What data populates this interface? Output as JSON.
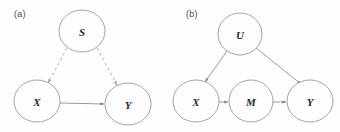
{
  "figure": {
    "background_color": "#fefefe",
    "node_fill": "#fdfdfd",
    "node_stroke": "#9a9a9a",
    "solid_edge_color": "#8e8e8e",
    "dashed_edge_color": "#a8a8a8",
    "label_color": "#2b2b2b"
  },
  "panels": [
    {
      "key": "a",
      "label": "(a)",
      "nodes": [
        {
          "id": "S",
          "label": "S",
          "cx": 82,
          "cy": 31,
          "rx": 23,
          "ry": 21
        },
        {
          "id": "X",
          "label": "X",
          "cx": 37,
          "cy": 101,
          "rx": 23,
          "ry": 21
        },
        {
          "id": "Y",
          "label": "Y",
          "cx": 128,
          "cy": 104,
          "rx": 23,
          "ry": 21
        }
      ],
      "edges": [
        {
          "from": "S",
          "to": "X",
          "style": "dashed",
          "arrow": true
        },
        {
          "from": "S",
          "to": "Y",
          "style": "dashed",
          "arrow": true
        },
        {
          "from": "X",
          "to": "Y",
          "style": "solid",
          "arrow": true
        }
      ]
    },
    {
      "key": "b",
      "label": "(b)",
      "nodes": [
        {
          "id": "U",
          "label": "U",
          "cx": 240,
          "cy": 34,
          "rx": 22,
          "ry": 21
        },
        {
          "id": "X",
          "label": "X",
          "cx": 196,
          "cy": 101,
          "rx": 23,
          "ry": 21
        },
        {
          "id": "M",
          "label": "M",
          "cx": 251,
          "cy": 101,
          "rx": 22,
          "ry": 21
        },
        {
          "id": "Y",
          "label": "Y",
          "cx": 310,
          "cy": 101,
          "rx": 23,
          "ry": 21
        }
      ],
      "edges": [
        {
          "from": "U",
          "to": "X",
          "style": "solid",
          "arrow": true
        },
        {
          "from": "U",
          "to": "Y",
          "style": "solid",
          "arrow": true
        },
        {
          "from": "X",
          "to": "M",
          "style": "solid",
          "arrow": true
        },
        {
          "from": "M",
          "to": "Y",
          "style": "solid",
          "arrow": true
        }
      ]
    }
  ]
}
